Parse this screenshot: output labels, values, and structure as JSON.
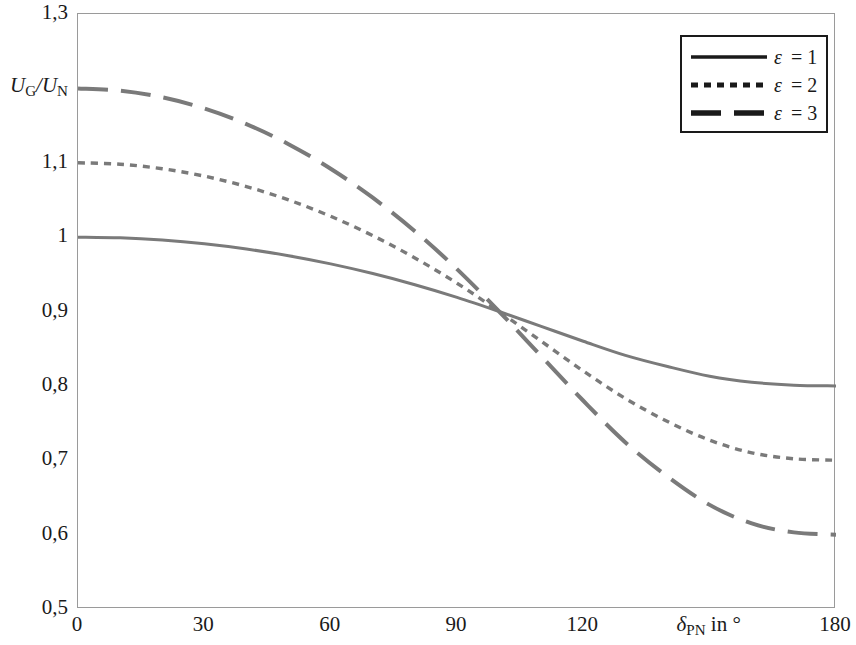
{
  "figure": {
    "background_color": "#ffffff",
    "frame_color": "#9a9a9a",
    "curve_color": "#7a7a7a",
    "legend_line_color": "#1a1a1a",
    "text_color": "#1a1a1a"
  },
  "axes": {
    "y": {
      "title_html": "U<sub>G</sub>/U<sub>N</sub>",
      "title_at_value": 1.2,
      "min": 0.5,
      "max": 1.3,
      "tick_values": [
        0.5,
        0.6,
        0.7,
        0.8,
        0.9,
        1.0,
        1.1,
        1.2,
        1.3
      ],
      "tick_labels": [
        "0,5",
        "0,6",
        "0,7",
        "0,8",
        "0,9",
        "1",
        "1,1",
        "",
        "1,3"
      ]
    },
    "x": {
      "title_html": "&delta;<sub>PN</sub> in &deg;",
      "title_at_value": 150,
      "min": 0,
      "max": 180,
      "tick_values": [
        0,
        30,
        60,
        90,
        120,
        150,
        180
      ],
      "tick_labels": [
        "0",
        "30",
        "60",
        "90",
        "120",
        "",
        "180"
      ]
    }
  },
  "legend": {
    "position": "top-right",
    "entries": [
      {
        "label_html": "&epsilon;&thinsp;= 1",
        "style": "solid",
        "dash": "none"
      },
      {
        "label_html": "&epsilon;&thinsp;= 2",
        "style": "dotted",
        "dash": "7,6"
      },
      {
        "label_html": "&epsilon;&thinsp;= 3",
        "style": "long-dashed",
        "dash": "30,13"
      }
    ]
  },
  "chart_data": {
    "type": "line",
    "title": "",
    "xlabel": "δ_PN in °",
    "ylabel": "U_G/U_N",
    "xlim": [
      0,
      180
    ],
    "ylim": [
      0.5,
      1.3
    ],
    "grid": false,
    "legend_position": "top-right",
    "x": [
      0,
      10,
      20,
      30,
      40,
      50,
      60,
      70,
      80,
      90,
      100,
      110,
      120,
      130,
      140,
      150,
      160,
      170,
      180
    ],
    "series": [
      {
        "name": "ε = 1",
        "line_style": "solid",
        "color": "#7a7a7a",
        "values": [
          1.0,
          0.999,
          0.996,
          0.991,
          0.984,
          0.975,
          0.964,
          0.951,
          0.936,
          0.919,
          0.9,
          0.88,
          0.86,
          0.841,
          0.826,
          0.813,
          0.805,
          0.801,
          0.8
        ]
      },
      {
        "name": "ε = 2",
        "line_style": "dotted",
        "color": "#7a7a7a",
        "values": [
          1.1,
          1.098,
          1.092,
          1.082,
          1.068,
          1.05,
          1.028,
          1.002,
          0.972,
          0.938,
          0.9,
          0.86,
          0.82,
          0.783,
          0.752,
          0.727,
          0.71,
          0.702,
          0.7
        ]
      },
      {
        "name": "ε = 3",
        "line_style": "long-dashed",
        "color": "#7a7a7a",
        "values": [
          1.2,
          1.197,
          1.188,
          1.173,
          1.152,
          1.125,
          1.092,
          1.053,
          1.008,
          0.957,
          0.9,
          0.84,
          0.78,
          0.724,
          0.678,
          0.64,
          0.615,
          0.603,
          0.6
        ]
      }
    ],
    "annotations": [
      {
        "text": "all curves intersect",
        "x": 103,
        "y": 0.883
      }
    ]
  }
}
